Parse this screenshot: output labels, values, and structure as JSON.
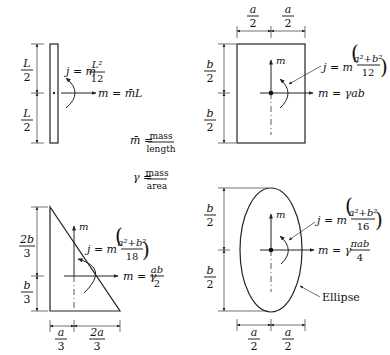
{
  "figure": "Mass moments of inertia for common shapes",
  "definitions": {
    "mbar": {
      "lhs": "m̄ =",
      "num": "mass",
      "den": "length"
    },
    "gamma": {
      "lhs": "γ =",
      "num": "mass",
      "den": "area"
    }
  },
  "rod": {
    "dim_top": {
      "num": "L",
      "den": "2"
    },
    "dim_bottom": {
      "num": "L",
      "den": "2"
    },
    "inertia": {
      "prefix": "j = m",
      "num": "L²",
      "den": "12"
    },
    "mass": "m = m̄L"
  },
  "rectangle": {
    "dim_left_top": {
      "num": "a",
      "den": "2"
    },
    "dim_right_top": {
      "num": "a",
      "den": "2"
    },
    "dim_upper": {
      "num": "b",
      "den": "2"
    },
    "dim_lower": {
      "num": "b",
      "den": "2"
    },
    "axis_label": "m",
    "inertia": {
      "prefix": "j = m",
      "num": "a²+b²",
      "den": "12"
    },
    "mass": "m = γab"
  },
  "triangle": {
    "dim_upper": {
      "num": "2b",
      "den": "3"
    },
    "dim_lower": {
      "num": "b",
      "den": "3"
    },
    "dim_left": {
      "num": "a",
      "den": "3"
    },
    "dim_right": {
      "num": "2a",
      "den": "3"
    },
    "axis_label": "m",
    "inertia": {
      "prefix": "j = m",
      "num": "a²+b²",
      "den": "18"
    },
    "mass": {
      "prefix": "m = γ",
      "num": "ab",
      "den": "2"
    }
  },
  "ellipse": {
    "dim_upper": {
      "num": "b",
      "den": "2"
    },
    "dim_lower": {
      "num": "b",
      "den": "2"
    },
    "dim_left": {
      "num": "a",
      "den": "2"
    },
    "dim_right": {
      "num": "a",
      "den": "2"
    },
    "axis_label": "m",
    "inertia": {
      "prefix": "j = m",
      "num": "a²+b²",
      "den": "16"
    },
    "mass": {
      "prefix": "m = γ",
      "num": "πab",
      "den": "4"
    },
    "callout": "Ellipse"
  }
}
